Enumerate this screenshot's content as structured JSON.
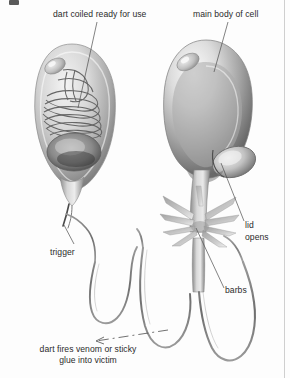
{
  "figure": {
    "background_color": "#fdfdfd",
    "text_color": "#2b2b2b",
    "rule_color": "#cfcfcf",
    "width": 290,
    "height": 378
  },
  "labels": {
    "dart_coiled": "dart coiled ready for use",
    "main_body": "main body of cell",
    "trigger": "trigger",
    "lid_opens": "lid\nopens",
    "lid_opens_line1": "lid",
    "lid_opens_line2": "opens",
    "barbs": "barbs",
    "dart_fires": "dart fires venom or sticky glue into victim",
    "dart_fires_line1": "dart fires venom or sticky",
    "dart_fires_line2": "glue into victim"
  },
  "illustration": {
    "left_cell": {
      "name": "undischarged nematocyst",
      "parts": [
        "capsule wall",
        "coiled dart",
        "operculum chamber",
        "trigger (cnidocil)"
      ]
    },
    "right_cell": {
      "name": "discharged nematocyst",
      "parts": [
        "capsule wall",
        "lid (operculum) opened",
        "everted shaft",
        "barbs",
        "thread"
      ]
    },
    "thread": {
      "name": "everted thread / dart",
      "description": "long undulating filament looping below both cells"
    },
    "leader_lines": [
      {
        "from_label": "dart_coiled",
        "x1": 97,
        "y1": 22,
        "x2": 78,
        "y2": 108
      },
      {
        "from_label": "main_body",
        "x1": 228,
        "y1": 22,
        "x2": 214,
        "y2": 72
      },
      {
        "from_label": "trigger",
        "x1": 74,
        "y1": 244,
        "x2": 64,
        "y2": 225
      },
      {
        "from_label": "lid_opens",
        "x1": 244,
        "y1": 221,
        "x2": 221,
        "y2": 163
      },
      {
        "from_label": "barbs",
        "x1": 224,
        "y1": 290,
        "x2": 196,
        "y2": 227
      },
      {
        "from_label": "dart_fires",
        "x1": 160,
        "y1": 332,
        "x2": 90,
        "y2": 341,
        "style": "dashed-arrow"
      }
    ]
  }
}
